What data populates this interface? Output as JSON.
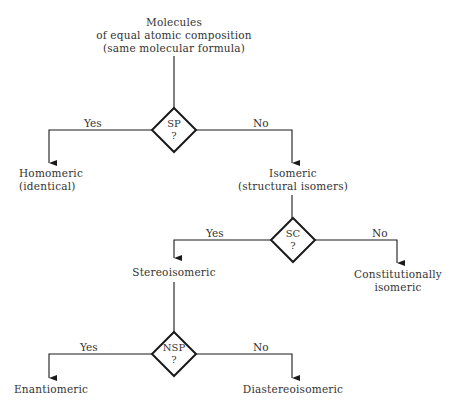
{
  "diagram": {
    "type": "flowchart",
    "root": {
      "line1": "Molecules",
      "line2": "of equal atomic composition",
      "line3": "(same molecular formula)"
    },
    "decisions": [
      {
        "id": "sp",
        "label": "SP",
        "q": "?"
      },
      {
        "id": "sc",
        "label": "SC",
        "q": "?"
      },
      {
        "id": "nsp",
        "label": "NSP",
        "q": "?"
      }
    ],
    "edges": {
      "sp_yes": "Yes",
      "sp_no": "No",
      "sc_yes": "Yes",
      "sc_no": "No",
      "nsp_yes": "Yes",
      "nsp_no": "No"
    },
    "nodes": {
      "homomeric": {
        "line1": "Homomeric",
        "line2": "(identical)"
      },
      "isomeric": {
        "line1": "Isomeric",
        "line2": "(structural isomers)"
      },
      "stereoisomeric": {
        "line1": "Stereoisomeric"
      },
      "constitutionally": {
        "line1": "Constitutionally",
        "line2": "isomeric"
      },
      "enantiomeric": {
        "line1": "Enantiomeric"
      },
      "diastereoisomeric": {
        "line1": "Diastereoisomeric"
      }
    },
    "colors": {
      "line": "#1a1a1a",
      "text": "#333333",
      "background": "#ffffff"
    }
  }
}
